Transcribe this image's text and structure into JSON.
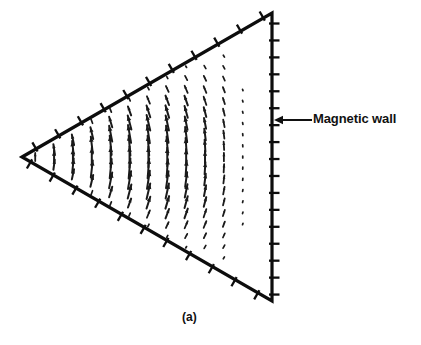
{
  "figure": {
    "caption": "(a)",
    "annotation_label": "Magnetic wall",
    "colors": {
      "ink": "#111111",
      "background": "#ffffff",
      "boundary": "#0d0d0d",
      "field": "#1a1a1a"
    }
  },
  "chart_data": {
    "type": "scatter",
    "title": "",
    "subtitle": "",
    "xlabel": "",
    "ylabel": "",
    "grid": false,
    "legend": null,
    "annotations": [
      {
        "text": "Magnetic wall",
        "target_x": 272,
        "target_y": 120,
        "arrow_from_x": 312,
        "arrow_from_y": 120,
        "label_x": 313,
        "label_y": 111
      },
      {
        "text": "(a)",
        "label_x": 182,
        "label_y": 310
      }
    ],
    "geometry": {
      "shape": "triangle",
      "description": "Equilateral triangular patch resonator, apex pointing left, vertical right edge",
      "vertices": [
        {
          "x": 22,
          "y": 157
        },
        {
          "x": 272,
          "y": 13
        },
        {
          "x": 272,
          "y": 301
        }
      ],
      "edges": [
        {
          "name": "upper-diagonal-wall",
          "from": 0,
          "to": 1,
          "tick_count": 11
        },
        {
          "name": "right-vertical-wall",
          "from": 1,
          "to": 2,
          "tick_count": 17
        },
        {
          "name": "lower-diagonal-wall",
          "from": 2,
          "to": 0,
          "tick_count": 11
        }
      ],
      "boundary_condition": "magnetic wall (open circuit) on all three edges, shown by perpendicular hatch ticks"
    },
    "field_plot": {
      "quantity": "electric field vector distribution of dominant TM10 mode",
      "arrow_columns": 13,
      "max_arrow_length": 22,
      "min_arrow_length": 3,
      "pattern": "Arrows fan outward from the left apex; near-vertical along the horizontal mid-line, tilting progressively toward the right edge, with magnitude decreasing from the mid-line toward the vertical right wall and toward the apex.",
      "x_range": [
        40,
        266
      ],
      "y_range": [
        18,
        296
      ]
    }
  }
}
